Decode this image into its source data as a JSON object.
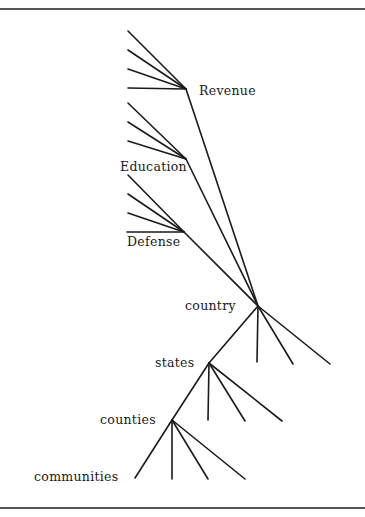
{
  "diagram": {
    "type": "tree",
    "frame": {
      "top_y": 9,
      "bottom_y": 508
    },
    "nodes": [
      {
        "id": "revenue",
        "label": "Revenue",
        "x": 186,
        "y": 89,
        "label_x": 199,
        "label_y": 95
      },
      {
        "id": "education",
        "label": "Education",
        "x": 186,
        "y": 159,
        "label_x": 120,
        "label_y": 171
      },
      {
        "id": "defense",
        "label": "Defense",
        "x": 184,
        "y": 232,
        "label_x": 127,
        "label_y": 246
      },
      {
        "id": "country",
        "label": "country",
        "x": 258,
        "y": 306,
        "label_x": 185,
        "label_y": 310
      },
      {
        "id": "states",
        "label": "states",
        "x": 209,
        "y": 363,
        "label_x": 155,
        "label_y": 367
      },
      {
        "id": "counties",
        "label": "counties",
        "x": 172,
        "y": 420,
        "label_x": 100,
        "label_y": 424
      },
      {
        "id": "communities",
        "label": "communities",
        "x": 135,
        "y": 478,
        "label_x": 34,
        "label_y": 481
      }
    ],
    "edges": [
      [
        128,
        31,
        186,
        89
      ],
      [
        128,
        50,
        186,
        89
      ],
      [
        128,
        69,
        186,
        89
      ],
      [
        128,
        88,
        186,
        89
      ],
      [
        128,
        103,
        186,
        159
      ],
      [
        128,
        122,
        186,
        159
      ],
      [
        128,
        141,
        186,
        159
      ],
      [
        128,
        175,
        184,
        232
      ],
      [
        128,
        194,
        184,
        232
      ],
      [
        128,
        213,
        184,
        232
      ],
      [
        127,
        232,
        184,
        232
      ],
      [
        186,
        89,
        258,
        306
      ],
      [
        186,
        159,
        258,
        306
      ],
      [
        184,
        232,
        258,
        306
      ],
      [
        258,
        306,
        209,
        363
      ],
      [
        258,
        306,
        257,
        362
      ],
      [
        258,
        306,
        293,
        364
      ],
      [
        258,
        306,
        330,
        364
      ],
      [
        209,
        363,
        172,
        420
      ],
      [
        209,
        363,
        208,
        420
      ],
      [
        209,
        363,
        245,
        421
      ],
      [
        209,
        363,
        282,
        421
      ],
      [
        172,
        420,
        135,
        478
      ],
      [
        172,
        420,
        172,
        479
      ],
      [
        172,
        420,
        208,
        479
      ],
      [
        172,
        420,
        245,
        479
      ]
    ]
  },
  "labels": {
    "revenue": "Revenue",
    "education": "Education",
    "defense": "Defense",
    "country": "country",
    "states": "states",
    "counties": "counties",
    "communities": "communities"
  }
}
